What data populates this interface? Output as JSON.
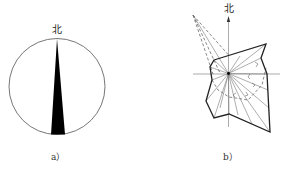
{
  "figure_a": {
    "label": "a）",
    "north_label": "北",
    "circle": {
      "cx": 57,
      "cy": 86.5,
      "r": 48
    },
    "needle": {
      "tip": [
        57,
        38.5
      ],
      "base_left": [
        51,
        134.5
      ],
      "base_right": [
        65,
        134.5
      ]
    },
    "colors": {
      "stroke": "#555555",
      "fill": "#000000"
    }
  },
  "figure_b": {
    "label": "b）",
    "north_label": "北",
    "center": [
      228.5,
      73.5
    ],
    "axes": {
      "h": [
        193,
        280
      ],
      "v": [
        18,
        127
      ]
    },
    "solid_polygon": [
      [
        214,
        60
      ],
      [
        266,
        44
      ],
      [
        261,
        58
      ],
      [
        267,
        74
      ],
      [
        270,
        132
      ],
      [
        229,
        114
      ],
      [
        214,
        118
      ],
      [
        206,
        101
      ],
      [
        212,
        80
      ],
      [
        210,
        67
      ]
    ],
    "dashed_far_point": [
      193,
      15
    ],
    "colors": {
      "stroke": "#333333",
      "thin": "#777777"
    }
  }
}
